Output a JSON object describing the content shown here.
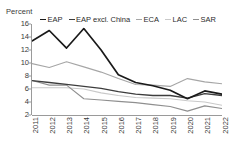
{
  "chart_data": {
    "type": "line",
    "title": "",
    "ylabel": "Percent",
    "xlabel": "",
    "ylim": [
      2,
      16
    ],
    "ytick_step": 2,
    "yticks": [
      "16",
      "14",
      "12",
      "10",
      "8",
      "6",
      "4",
      "2"
    ],
    "grid": false,
    "legend_position": "top",
    "categories": [
      "2011",
      "2012",
      "2013",
      "2014",
      "2015",
      "2016",
      "2017",
      "2018",
      "2019",
      "2020",
      "2021",
      "2022"
    ],
    "series": [
      {
        "name": "EAP",
        "color": "#1a1a1a",
        "width": 1.7,
        "values": [
          13.4,
          15.0,
          12.3,
          15.3,
          12.0,
          8.2,
          7.0,
          6.5,
          5.8,
          4.5,
          5.7,
          5.2
        ]
      },
      {
        "name": "EAP excl. China",
        "color": "#3d3d3d",
        "width": 1.3,
        "values": [
          7.3,
          7.0,
          6.7,
          6.4,
          6.1,
          5.6,
          5.2,
          5.0,
          5.0,
          4.6,
          5.3,
          5.0
        ]
      },
      {
        "name": "ECA",
        "color": "#a6a6a6",
        "width": 1.1,
        "values": [
          9.9,
          9.3,
          10.2,
          9.4,
          8.6,
          7.6,
          6.7,
          6.6,
          6.4,
          7.6,
          7.1,
          6.8
        ]
      },
      {
        "name": "LAC",
        "color": "#c9c9c9",
        "width": 1.1,
        "values": [
          6.2,
          6.2,
          6.2,
          6.0,
          5.4,
          5.0,
          4.7,
          4.6,
          4.5,
          4.2,
          4.0,
          3.5
        ]
      },
      {
        "name": "SAR",
        "color": "#8f8f8f",
        "width": 1.1,
        "values": [
          7.3,
          6.6,
          6.6,
          4.5,
          4.3,
          4.1,
          3.9,
          3.6,
          3.3,
          2.6,
          3.4,
          3.0
        ]
      }
    ]
  },
  "legend": {
    "items": [
      {
        "label": "EAP"
      },
      {
        "label": "EAP excl. China"
      },
      {
        "label": "ECA"
      },
      {
        "label": "LAC"
      },
      {
        "label": "SAR"
      }
    ]
  }
}
